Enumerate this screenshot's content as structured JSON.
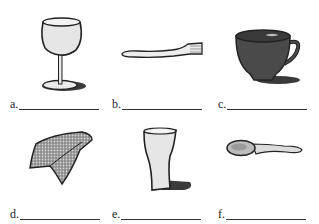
{
  "worksheet": {
    "items": [
      {
        "letter": "a.",
        "icon": "wine-glass-icon",
        "answer": ""
      },
      {
        "letter": "b.",
        "icon": "fork-icon",
        "answer": ""
      },
      {
        "letter": "c.",
        "icon": "cup-icon",
        "answer": ""
      },
      {
        "letter": "d.",
        "icon": "napkin-icon",
        "answer": ""
      },
      {
        "letter": "e.",
        "icon": "glass-icon",
        "answer": ""
      },
      {
        "letter": "f.",
        "icon": "spoon-icon",
        "answer": ""
      }
    ]
  },
  "colors": {
    "ink": "#222222",
    "cup_fill": "#4a4a4a",
    "glass_fill": "#e6e6e6",
    "shadow": "#3a3a3a",
    "napkin_fill": "#9a9a9a"
  }
}
